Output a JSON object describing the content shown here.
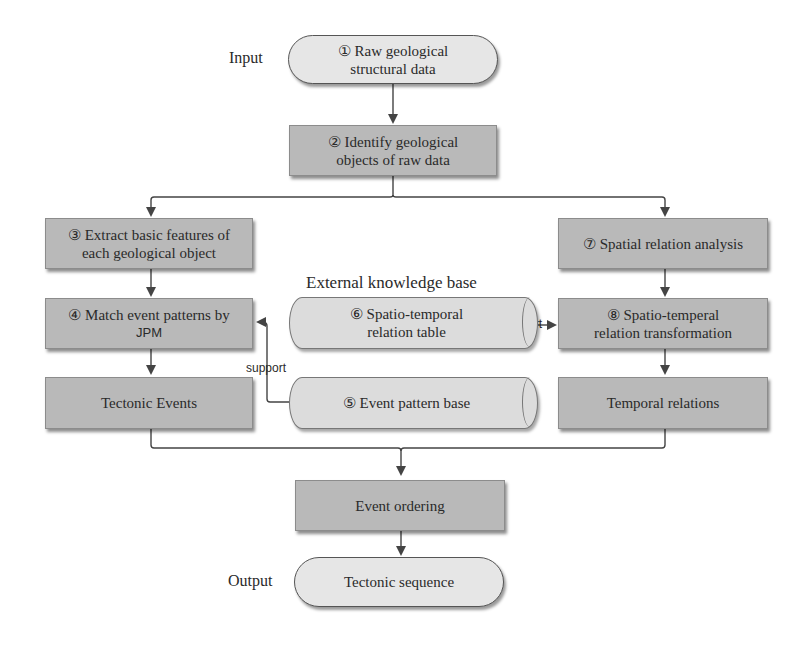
{
  "diagram": {
    "labels": {
      "input": "Input",
      "output": "Output",
      "external_kb": "External knowledge base",
      "support_left": "support",
      "support_right": "support"
    },
    "nodes": {
      "n1": {
        "line1": "① Raw geological",
        "line2": "structural data",
        "shape": "terminal"
      },
      "n2": {
        "line1": "② Identify geological",
        "line2": "objects of raw data",
        "shape": "process"
      },
      "n3": {
        "line1": "③ Extract basic features of",
        "line2": "each geological object",
        "shape": "process"
      },
      "n4": {
        "line1": "④ Match event patterns by",
        "line2": "JPM",
        "shape": "process"
      },
      "n5": {
        "line1": "⑤ Event pattern base",
        "shape": "database"
      },
      "n6": {
        "line1": "⑥ Spatio-temporal",
        "line2": "relation table",
        "shape": "database"
      },
      "n7": {
        "line1": "⑦ Spatial relation analysis",
        "shape": "process"
      },
      "n8": {
        "line1": "⑧ Spatio-temperal",
        "line2": "relation transformation",
        "shape": "process"
      },
      "tectonic_events": {
        "line1": "Tectonic Events",
        "shape": "process"
      },
      "temporal_relations": {
        "line1": "Temporal relations",
        "shape": "process"
      },
      "event_ordering": {
        "line1": "Event ordering",
        "shape": "process"
      },
      "tectonic_sequence": {
        "line1": "Tectonic sequence",
        "shape": "terminal"
      }
    },
    "colors": {
      "process_fill": "#b9b9b9",
      "terminal_fill": "#e6e6e6",
      "database_fill": "#dcdcdc",
      "line": "#444444"
    }
  }
}
